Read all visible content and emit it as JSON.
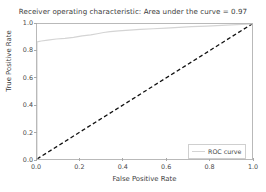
{
  "chart_data": {
    "type": "line",
    "title": "Receiver operating characteristic: Area under the curve = 0.97",
    "xlabel": "False Positive Rate",
    "ylabel": "True Positive Rate",
    "xlim": [
      0.0,
      1.0
    ],
    "ylim": [
      0.0,
      1.0
    ],
    "xticks": [
      "0.0",
      "0.2",
      "0.4",
      "0.6",
      "0.8",
      "1.0"
    ],
    "yticks": [
      "0.0",
      "0.2",
      "0.4",
      "0.6",
      "0.8",
      "1.0"
    ],
    "xtick_values": [
      0.0,
      0.2,
      0.4,
      0.6,
      0.8,
      1.0
    ],
    "ytick_values": [
      0.0,
      0.2,
      0.4,
      0.6,
      0.8,
      1.0
    ],
    "grid": false,
    "auc": 0.97,
    "legend_position": "lower right",
    "legend_entries": [
      {
        "name": "ROC curve",
        "color": "#d4d4d4",
        "style": "solid"
      }
    ],
    "series": [
      {
        "name": "ROC curve",
        "color": "#d4d4d4",
        "style": "solid",
        "width": 1.2,
        "x": [
          0.0,
          0.0,
          0.02,
          0.05,
          0.09,
          0.13,
          0.17,
          0.21,
          0.25,
          0.28,
          0.31,
          0.34,
          0.38,
          0.43,
          0.48,
          0.54,
          0.6,
          0.66,
          0.72,
          0.79,
          0.86,
          0.93,
          1.0
        ],
        "y": [
          0.0,
          0.868,
          0.874,
          0.881,
          0.889,
          0.894,
          0.901,
          0.912,
          0.919,
          0.928,
          0.937,
          0.944,
          0.949,
          0.955,
          0.96,
          0.965,
          0.97,
          0.975,
          0.98,
          0.985,
          0.99,
          0.995,
          1.0
        ]
      },
      {
        "name": "chance",
        "color": "#111111",
        "style": "dashed",
        "width": 1.3,
        "x": [
          0.0,
          1.0
        ],
        "y": [
          0.0,
          1.0
        ]
      }
    ]
  },
  "figure": {
    "background_color": "#ffffff",
    "frame_color": "#b9b9b9",
    "tick_color": "#a8a8a8",
    "text_color": "#3b3b3b"
  }
}
